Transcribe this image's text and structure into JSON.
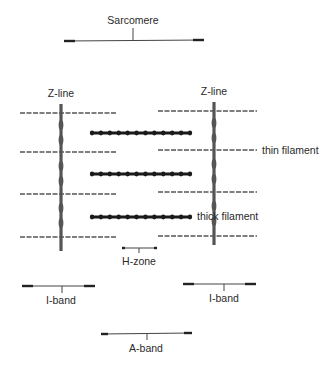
{
  "title": "Sarcomere",
  "labels": {
    "sarcomere": "Sarcomere",
    "z_line_left": "Z-line",
    "z_line_right": "Z-line",
    "thin_filament": "thin filament",
    "thick_filament": "thick filament",
    "h_zone": "H-zone",
    "i_band_left": "I-band",
    "i_band_right": "I-band",
    "a_band": "A-band"
  },
  "structure": {
    "z_lines": 2,
    "thin_filaments_per_side": 4,
    "thick_filaments": 3
  }
}
